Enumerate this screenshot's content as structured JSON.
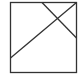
{
  "diagram": {
    "stroke_color": "#333333",
    "background": "#ffffff",
    "frame": {
      "x": 10.5,
      "y": 2.5,
      "width": 66,
      "height": 70
    },
    "lines": [
      {
        "x1": 10.5,
        "y1": 58,
        "x2": 76.5,
        "y2": 2.5
      },
      {
        "x1": 42,
        "y1": 2.5,
        "x2": 76.5,
        "y2": 38
      }
    ]
  }
}
